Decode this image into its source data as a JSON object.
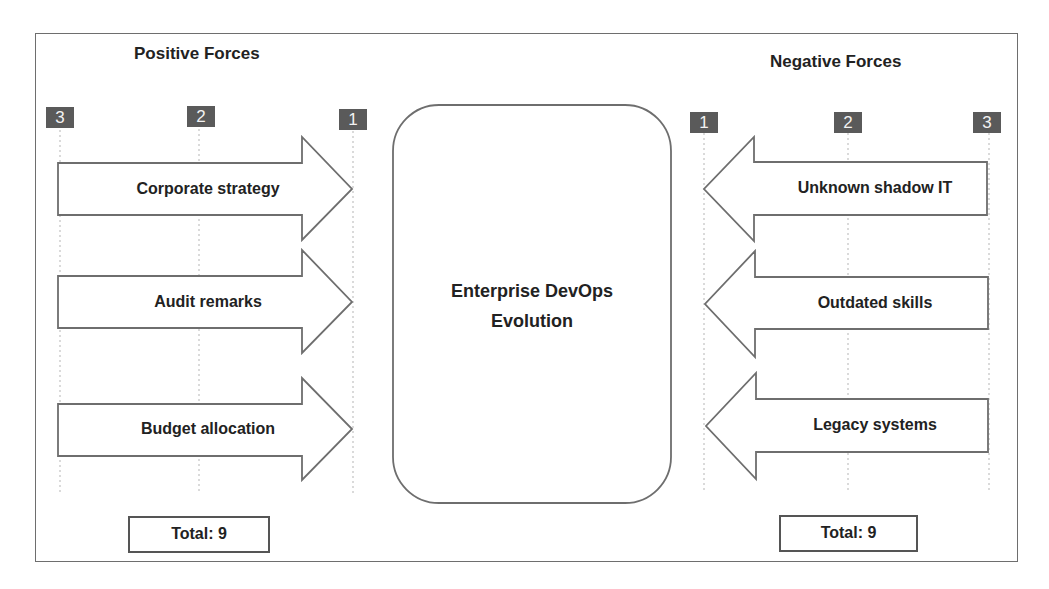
{
  "diagram": {
    "type": "force-field-analysis",
    "center": {
      "title": "Enterprise DevOps Evolution",
      "line1": "Enterprise DevOps",
      "line2": "Evolution"
    },
    "positive": {
      "heading": "Positive Forces",
      "scale": [
        "3",
        "2",
        "1"
      ],
      "forces": [
        {
          "label": "Corporate strategy",
          "strength": 3
        },
        {
          "label": "Audit remarks",
          "strength": 3
        },
        {
          "label": "Budget allocation",
          "strength": 3
        }
      ],
      "total": "Total: 9"
    },
    "negative": {
      "heading": "Negative Forces",
      "scale": [
        "1",
        "2",
        "3"
      ],
      "forces": [
        {
          "label": "Unknown shadow IT",
          "strength": 3
        },
        {
          "label": "Outdated skills",
          "strength": 3
        },
        {
          "label": "Legacy systems",
          "strength": 3
        }
      ],
      "total": "Total: 9"
    },
    "colors": {
      "stroke": "#6e6e6e",
      "badge": "#5a5a5a",
      "text": "#222222",
      "grid": "#b5b5b5"
    }
  }
}
